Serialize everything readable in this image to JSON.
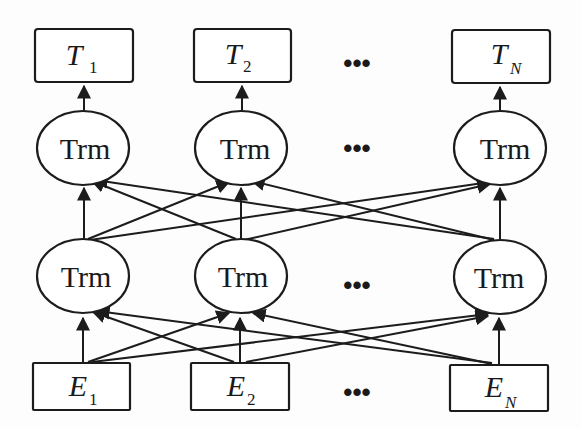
{
  "diagram": {
    "type": "bidirectional-transformer-architecture",
    "outputs": [
      {
        "id": "T1",
        "symbol": "T",
        "subscript": "1"
      },
      {
        "id": "T2",
        "symbol": "T",
        "subscript": "2"
      },
      {
        "id": "TN",
        "symbol": "T",
        "subscript": "N"
      }
    ],
    "top_layer": [
      {
        "id": "trm_top_1",
        "label": "Trm"
      },
      {
        "id": "trm_top_2",
        "label": "Trm"
      },
      {
        "id": "trm_top_N",
        "label": "Trm"
      }
    ],
    "bottom_layer": [
      {
        "id": "trm_bot_1",
        "label": "Trm"
      },
      {
        "id": "trm_bot_2",
        "label": "Trm"
      },
      {
        "id": "trm_bot_N",
        "label": "Trm"
      }
    ],
    "inputs": [
      {
        "id": "E1",
        "symbol": "E",
        "subscript": "1"
      },
      {
        "id": "E2",
        "symbol": "E",
        "subscript": "2"
      },
      {
        "id": "EN",
        "symbol": "E",
        "subscript": "N"
      }
    ],
    "ellipsis": "•••",
    "connections": {
      "inputs_to_bottom_layer": "fully-connected",
      "bottom_layer_to_top_layer": "fully-connected",
      "top_layer_to_outputs": "one-to-one"
    }
  }
}
